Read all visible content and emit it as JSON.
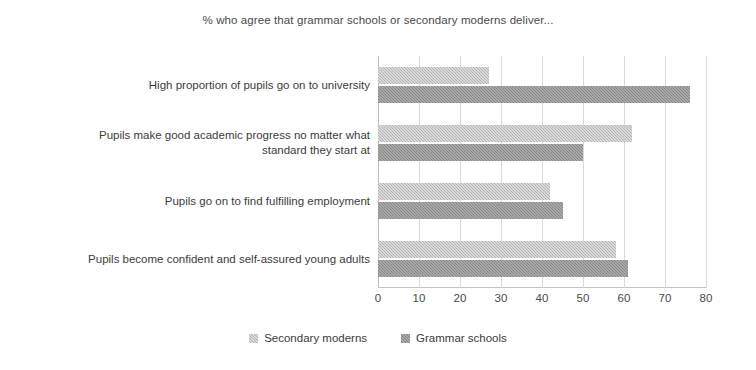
{
  "chart_data": {
    "type": "bar",
    "orientation": "horizontal",
    "title": "% who agree that grammar schools or secondary moderns deliver...",
    "xlabel": "",
    "ylabel": "",
    "xlim": [
      0,
      80
    ],
    "xticks": [
      0,
      10,
      20,
      30,
      40,
      50,
      60,
      70,
      80
    ],
    "grid": true,
    "legend_position": "bottom",
    "categories": [
      "High proportion of pupils go on to university",
      "Pupils make good academic progress no matter what standard they start at",
      "Pupils go on to find fulfilling employment",
      "Pupils become confident and self-assured young adults"
    ],
    "category_lines": [
      [
        "High proportion of pupils go on to university"
      ],
      [
        "Pupils make good academic progress no matter what",
        "standard they start at"
      ],
      [
        "Pupils go on to find fulfilling employment"
      ],
      [
        "Pupils become confident and self-assured young adults"
      ]
    ],
    "series": [
      {
        "name": "Secondary moderns",
        "color": "#b3b3b3",
        "values": [
          27,
          62,
          42,
          58
        ]
      },
      {
        "name": "Grammar schools",
        "color": "#878787",
        "values": [
          76,
          50,
          45,
          61
        ]
      }
    ]
  },
  "legend": {
    "items": [
      {
        "label": "Secondary moderns",
        "color": "#b3b3b3"
      },
      {
        "label": "Grammar schools",
        "color": "#878787"
      }
    ]
  },
  "axis": {
    "tick_labels": [
      "0",
      "10",
      "20",
      "30",
      "40",
      "50",
      "60",
      "70",
      "80"
    ]
  }
}
